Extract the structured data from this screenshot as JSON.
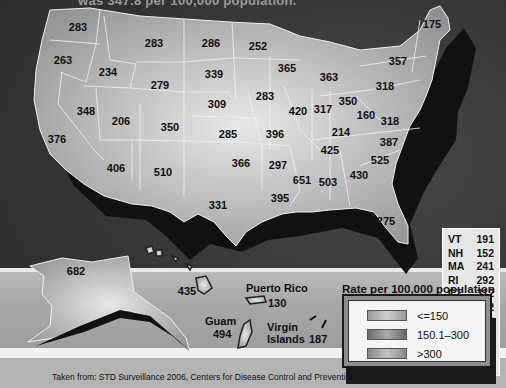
{
  "title": "was 347.8 per 100,000 population.",
  "states": [
    {
      "abbr": "WA",
      "value": "283",
      "x": 78,
      "y": 27
    },
    {
      "abbr": "OR",
      "value": "263",
      "x": 63,
      "y": 60
    },
    {
      "abbr": "ID",
      "value": "234",
      "x": 108,
      "y": 72
    },
    {
      "abbr": "MT",
      "value": "283",
      "x": 154,
      "y": 43
    },
    {
      "abbr": "ND",
      "value": "286",
      "x": 211,
      "y": 43
    },
    {
      "abbr": "MN",
      "value": "252",
      "x": 258,
      "y": 46
    },
    {
      "abbr": "WY",
      "value": "279",
      "x": 160,
      "y": 85
    },
    {
      "abbr": "SD",
      "value": "339",
      "x": 214,
      "y": 74
    },
    {
      "abbr": "NV",
      "value": "348",
      "x": 86,
      "y": 111
    },
    {
      "abbr": "UT",
      "value": "206",
      "x": 121,
      "y": 121
    },
    {
      "abbr": "CO",
      "value": "350",
      "x": 170,
      "y": 127
    },
    {
      "abbr": "NE",
      "value": "309",
      "x": 217,
      "y": 104
    },
    {
      "abbr": "KS",
      "value": "285",
      "x": 228,
      "y": 134
    },
    {
      "abbr": "CA",
      "value": "376",
      "x": 57,
      "y": 139
    },
    {
      "abbr": "AZ",
      "value": "406",
      "x": 116,
      "y": 168
    },
    {
      "abbr": "NM",
      "value": "510",
      "x": 163,
      "y": 172
    },
    {
      "abbr": "OK",
      "value": "366",
      "x": 241,
      "y": 163
    },
    {
      "abbr": "TX",
      "value": "331",
      "x": 218,
      "y": 205
    },
    {
      "abbr": "IA",
      "value": "283",
      "x": 265,
      "y": 96
    },
    {
      "abbr": "WI",
      "value": "365",
      "x": 287,
      "y": 68
    },
    {
      "abbr": "MI",
      "value": "363",
      "x": 329,
      "y": 77
    },
    {
      "abbr": "IL",
      "value": "420",
      "x": 298,
      "y": 111
    },
    {
      "abbr": "IN",
      "value": "317",
      "x": 323,
      "y": 109
    },
    {
      "abbr": "OH",
      "value": "350",
      "x": 348,
      "y": 101
    },
    {
      "abbr": "MO",
      "value": "396",
      "x": 275,
      "y": 134
    },
    {
      "abbr": "WV",
      "value": "160",
      "x": 366,
      "y": 115
    },
    {
      "abbr": "PA",
      "value": "318",
      "x": 385,
      "y": 86
    },
    {
      "abbr": "NY",
      "value": "357",
      "x": 398,
      "y": 61
    },
    {
      "abbr": "ME",
      "value": "175",
      "x": 432,
      "y": 24
    },
    {
      "abbr": "VA",
      "value": "318",
      "x": 390,
      "y": 121
    },
    {
      "abbr": "KY",
      "value": "214",
      "x": 341,
      "y": 132
    },
    {
      "abbr": "NC",
      "value": "387",
      "x": 389,
      "y": 142
    },
    {
      "abbr": "TN",
      "value": "425",
      "x": 330,
      "y": 150
    },
    {
      "abbr": "AR",
      "value": "297",
      "x": 278,
      "y": 165
    },
    {
      "abbr": "SC",
      "value": "525",
      "x": 380,
      "y": 160
    },
    {
      "abbr": "MS",
      "value": "651",
      "x": 302,
      "y": 180
    },
    {
      "abbr": "AL",
      "value": "503",
      "x": 328,
      "y": 182
    },
    {
      "abbr": "GA",
      "value": "430",
      "x": 359,
      "y": 175
    },
    {
      "abbr": "LA",
      "value": "395",
      "x": 280,
      "y": 198
    },
    {
      "abbr": "FL",
      "value": "275",
      "x": 386,
      "y": 221
    }
  ],
  "small_states_table": [
    {
      "abbr": "VT",
      "value": "191"
    },
    {
      "abbr": "NH",
      "value": "152"
    },
    {
      "abbr": "MA",
      "value": "241"
    },
    {
      "abbr": "RI",
      "value": "292"
    },
    {
      "abbr": "CT",
      "value": "312"
    },
    {
      "abbr": "NJ",
      "value": "232"
    },
    {
      "abbr": "DE",
      "value": "429"
    },
    {
      "abbr": "MD",
      "value": "390"
    },
    {
      "abbr": "DC",
      "value": "612"
    }
  ],
  "territories": {
    "alaska": {
      "value": "682"
    },
    "hawaii": {
      "value": "435"
    },
    "puerto_rico": {
      "name": "Puerto Rico",
      "value": "130"
    },
    "guam": {
      "name": "Guam",
      "value": "494"
    },
    "virgin_islands": {
      "name_line1": "Virgin",
      "name_line2": "Islands",
      "value": "187"
    }
  },
  "legend": {
    "title": "Rate per 100,000 population",
    "items": [
      {
        "label": "<=150",
        "color": "#b8b8b8"
      },
      {
        "label": "150.1–300",
        "color": "#8a8a8a"
      },
      {
        "label": ">300",
        "color": "#a6a6a6"
      }
    ]
  },
  "source": "Taken from: STD Surveillance 2006, Centers  for Disease Control and Prevention."
}
